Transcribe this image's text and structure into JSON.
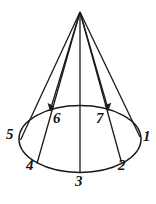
{
  "figure": {
    "name": "cone-with-numbered-base-points",
    "background_color": "#ffffff",
    "stroke_color": "#1a1a1a",
    "label_color": "#141414",
    "apex": {
      "x": 80,
      "y": 12
    },
    "base_ellipse": {
      "cx": 80,
      "cy": 139,
      "rx": 61,
      "ry": 33.5
    },
    "points": [
      {
        "id": "1",
        "label": "1",
        "x": 140.0,
        "y": 137.0,
        "label_x": 143,
        "label_y": 129,
        "arrow": false
      },
      {
        "id": "2",
        "label": "2",
        "x": 121.5,
        "y": 162.5,
        "label_x": 118,
        "label_y": 158,
        "arrow": false
      },
      {
        "id": "3",
        "label": "3",
        "x": 80.0,
        "y": 172.5,
        "label_x": 75,
        "label_y": 174,
        "arrow": false
      },
      {
        "id": "4",
        "label": "4",
        "x": 37.0,
        "y": 163.5,
        "label_x": 26,
        "label_y": 158,
        "arrow": false
      },
      {
        "id": "5",
        "label": "5",
        "x": 20.5,
        "y": 140.0,
        "label_x": 6,
        "label_y": 127,
        "arrow": false
      },
      {
        "id": "6",
        "label": "6",
        "x": 50.0,
        "y": 111.0,
        "label_x": 53,
        "label_y": 111,
        "arrow": true
      },
      {
        "id": "7",
        "label": "7",
        "x": 108.5,
        "y": 110.5,
        "label_x": 96,
        "label_y": 111,
        "arrow": true
      }
    ],
    "axis_line": {
      "from": {
        "x": 80,
        "y": 12
      },
      "to": {
        "x": 80,
        "y": 172.5
      }
    },
    "caption": ""
  }
}
